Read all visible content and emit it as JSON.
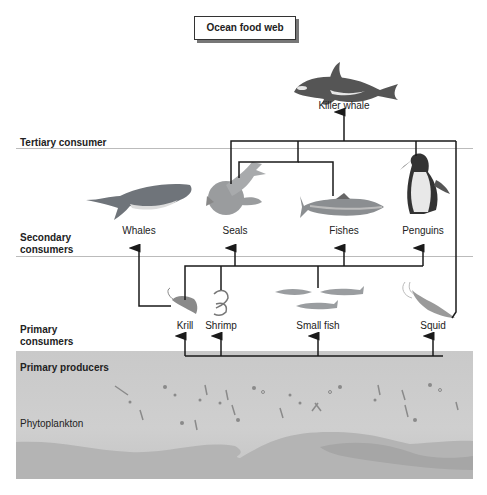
{
  "title": "Ocean food web",
  "levels": {
    "tertiary": "Tertiary consumer",
    "secondary": [
      "Secondary",
      "consumers"
    ],
    "primary": [
      "Primary",
      "consumers"
    ],
    "producers": "Primary producers"
  },
  "organisms": {
    "killer_whale": "Killer whale",
    "whales": "Whales",
    "seals": "Seals",
    "fishes": "Fishes",
    "penguins": "Penguins",
    "krill": "Krill",
    "shrimp": "Shrimp",
    "small_fish": "Small fish",
    "squid": "Squid",
    "phytoplankton": "Phytoplankton"
  },
  "colors": {
    "line": "#1a1a1a",
    "divider": "#bbbbbb",
    "producer_bg": "#cacaca",
    "animal_gray": "#6e7378"
  },
  "links": [
    {
      "from": "Phytoplankton",
      "to": "Krill"
    },
    {
      "from": "Phytoplankton",
      "to": "Shrimp"
    },
    {
      "from": "Phytoplankton",
      "to": "Small fish"
    },
    {
      "from": "Phytoplankton",
      "to": "Squid"
    },
    {
      "from": "Krill",
      "to": "Whales"
    },
    {
      "from": "Krill",
      "to": "Seals"
    },
    {
      "from": "Shrimp",
      "to": "Seals"
    },
    {
      "from": "Small fish",
      "to": "Fishes"
    },
    {
      "from": "Small fish",
      "to": "Penguins"
    },
    {
      "from": "Seals",
      "to": "Killer whale"
    },
    {
      "from": "Fishes",
      "to": "Killer whale"
    },
    {
      "from": "Penguins",
      "to": "Killer whale"
    },
    {
      "from": "Squid",
      "to": "Killer whale"
    }
  ]
}
